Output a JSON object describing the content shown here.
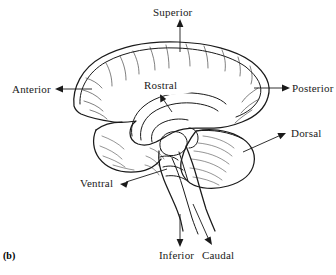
{
  "figure": {
    "caption": "(b)"
  },
  "labels": {
    "superior": "Superior",
    "anterior": "Anterior",
    "posterior": "Posterior",
    "dorsal": "Dorsal",
    "ventral": "Ventral",
    "inferior": "Inferior",
    "caudal": "Caudal",
    "rostral": "Rostral"
  },
  "colors": {
    "background": "#ffffff",
    "ink": "#1a1a1a",
    "detail": "#2a2a2a"
  },
  "arrows": [
    {
      "name": "superior-arrow",
      "label": "Superior",
      "direction": "up",
      "from": [
        180,
        52
      ],
      "to": [
        180,
        21
      ]
    },
    {
      "name": "anterior-arrow",
      "label": "Anterior",
      "direction": "left",
      "from": [
        90,
        89
      ],
      "to": [
        56,
        89
      ]
    },
    {
      "name": "posterior-arrow",
      "label": "Posterior",
      "direction": "right",
      "from": [
        255,
        88
      ],
      "to": [
        289,
        88
      ]
    },
    {
      "name": "dorsal-arrow",
      "label": "Dorsal",
      "direction": "up-right",
      "from": [
        243,
        151
      ],
      "to": [
        286,
        133
      ]
    },
    {
      "name": "ventral-arrow",
      "label": "Ventral",
      "direction": "down-left",
      "from": [
        166,
        169
      ],
      "to": [
        121,
        183
      ]
    },
    {
      "name": "inferior-arrow",
      "label": "Inferior",
      "direction": "down",
      "from": [
        180,
        215
      ],
      "to": [
        180,
        246
      ]
    },
    {
      "name": "caudal-arrow",
      "label": "Caudal",
      "direction": "down-right",
      "from": [
        194,
        205
      ],
      "to": [
        212,
        245
      ]
    },
    {
      "name": "rostral-arrow",
      "label": "Rostral",
      "direction": "up-left",
      "from": [
        170,
        110
      ],
      "to": [
        160,
        96
      ]
    }
  ],
  "structures": [
    {
      "name": "cerebral-cortex",
      "description": "Cerebral hemisphere with sulci and gyri"
    },
    {
      "name": "corpus-callosum",
      "description": "Corpus callosum arc"
    },
    {
      "name": "cerebellum",
      "description": "Cerebellum with folia"
    },
    {
      "name": "brainstem",
      "description": "Brainstem and spinal cord"
    }
  ]
}
